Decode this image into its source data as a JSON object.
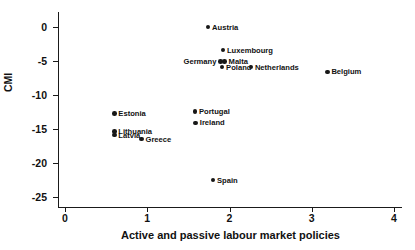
{
  "chart_data": {
    "type": "scatter",
    "title": "",
    "xlabel": "Active and passive labour market policies",
    "ylabel": "CMI",
    "xlim": [
      0,
      4
    ],
    "ylim": [
      -25,
      0
    ],
    "xticks": [
      "0",
      "1",
      "2",
      "3",
      "4"
    ],
    "xtickvalues": [
      0,
      1,
      2,
      3,
      4
    ],
    "yticks": [
      "0",
      "-5",
      "-10",
      "-15",
      "-20",
      "-25"
    ],
    "ytickvalues": [
      0,
      -5,
      -10,
      -15,
      -20,
      -25
    ],
    "grid": false,
    "legend": false,
    "marker_color": "#171717",
    "axis_color": "#1a1a1a",
    "points": [
      {
        "label": "Austria",
        "x": 1.74,
        "y": 0.0,
        "label_pos": "right"
      },
      {
        "label": "Luxembourg",
        "x": 1.92,
        "y": -3.4,
        "label_pos": "right"
      },
      {
        "label": "Malta",
        "x": 1.94,
        "y": -5.1,
        "label_pos": "right"
      },
      {
        "label": "Germany",
        "x": 1.89,
        "y": -5.1,
        "label_pos": "left"
      },
      {
        "label": "Poland",
        "x": 1.91,
        "y": -5.9,
        "label_pos": "right"
      },
      {
        "label": "Netherlands",
        "x": 2.26,
        "y": -5.9,
        "label_pos": "right"
      },
      {
        "label": "Belgium",
        "x": 3.19,
        "y": -6.6,
        "label_pos": "right"
      },
      {
        "label": "Estonia",
        "x": 0.6,
        "y": -12.7,
        "label_pos": "right"
      },
      {
        "label": "Portugal",
        "x": 1.58,
        "y": -12.4,
        "label_pos": "right"
      },
      {
        "label": "Ireland",
        "x": 1.59,
        "y": -14.1,
        "label_pos": "right"
      },
      {
        "label": "Lithuania",
        "x": 0.6,
        "y": -15.4,
        "label_pos": "right"
      },
      {
        "label": "Latvia",
        "x": 0.6,
        "y": -15.9,
        "label_pos": "right"
      },
      {
        "label": "Greece",
        "x": 0.93,
        "y": -16.5,
        "label_pos": "right"
      },
      {
        "label": "Spain",
        "x": 1.8,
        "y": -22.5,
        "label_pos": "right"
      }
    ]
  }
}
